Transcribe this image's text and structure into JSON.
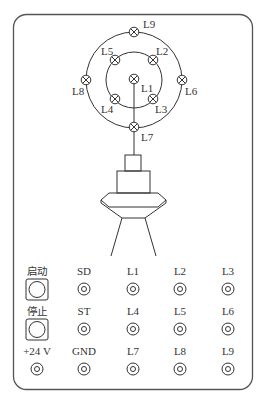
{
  "lamps": {
    "L1": "L1",
    "L2": "L2",
    "L3": "L3",
    "L4": "L4",
    "L5": "L5",
    "L6": "L6",
    "L7": "L7",
    "L8": "L8",
    "L9": "L9"
  },
  "panel": {
    "buttons": {
      "start_label": "启动",
      "stop_label": "停止"
    },
    "rows": [
      [
        "SD",
        "L1",
        "L2",
        "L3"
      ],
      [
        "ST",
        "L4",
        "L5",
        "L6"
      ],
      [
        "+24 V",
        "GND",
        "L7",
        "L8",
        "L9"
      ]
    ]
  },
  "colors": {
    "line": "#333333",
    "frame": "#555555"
  }
}
